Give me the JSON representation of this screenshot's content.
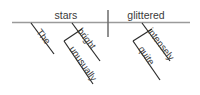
{
  "diagram": {
    "type": "reed-kellogg-sentence-diagram",
    "sentence": "The unusually bright stars glittered quite intensely.",
    "colors": {
      "baseline_rule": "#9a9a9a",
      "divider": "#6b6b6b",
      "modifier_line": "#2b2b2b",
      "text": "#3a3a3a",
      "background": "#ffffff"
    },
    "subject": {
      "label": "stars",
      "part_of_speech": "noun"
    },
    "predicate": {
      "label": "glittered",
      "part_of_speech": "verb"
    },
    "modifiers": [
      {
        "label": "The",
        "part_of_speech": "article",
        "modifies": "stars",
        "branch": "subject"
      },
      {
        "label": "bright",
        "part_of_speech": "adjective",
        "modifies": "stars",
        "branch": "subject"
      },
      {
        "label": "unusually",
        "part_of_speech": "adverb",
        "modifies": "bright",
        "branch": "subject"
      },
      {
        "label": "intensely",
        "part_of_speech": "adverb",
        "modifies": "glittered",
        "branch": "predicate"
      },
      {
        "label": "quite",
        "part_of_speech": "adverb",
        "modifies": "intensely",
        "branch": "predicate"
      }
    ]
  }
}
